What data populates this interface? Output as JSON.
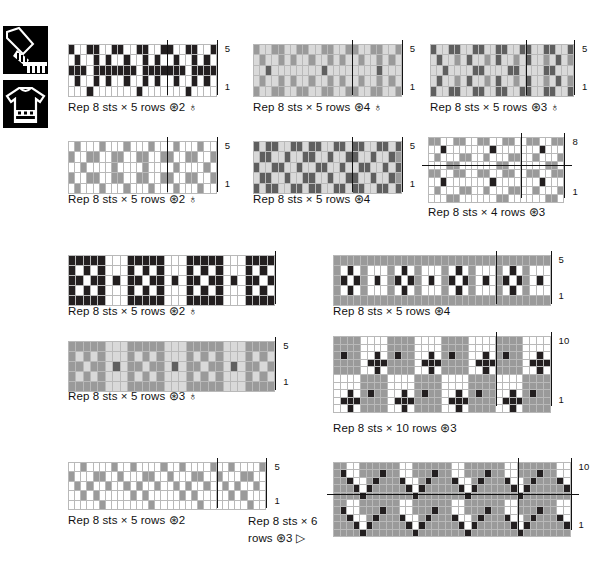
{
  "page": {
    "icons": [
      {
        "name": "cuff-icon",
        "label": "cuff"
      },
      {
        "name": "sweater-icon",
        "label": "sweater"
      }
    ],
    "palette": {
      "white": "#ffffff",
      "light_gray": "#d9d9d9",
      "medium_gray": "#9a9a9a",
      "dark_gray": "#5f5f5f",
      "black": "#231f20",
      "grid_line": "#b9b9b9",
      "marker_line": "#121212"
    },
    "symbols": {
      "yarn_ball": "⊛",
      "needle": "♁",
      "triangle": "▷",
      "multiply": "×"
    }
  },
  "charts": [
    {
      "id": "chart-1",
      "caption": "Rep 8 sts × 5 rows  ⊛2 ♁",
      "rep_sts": 8,
      "rep_rows": 5,
      "yarns": 2,
      "has_needle": true,
      "row_labels": [
        {
          "text": "5",
          "row": 5
        },
        {
          "text": "1",
          "row": 1
        }
      ],
      "cols": 24,
      "rows": 5,
      "cellw": 6.2,
      "cellh": 9.4,
      "vlines": [
        16,
        24
      ],
      "hlines": [],
      "grid": [
        "kwwkkwwkkwwkkwwkkwwkkwwk",
        "wkwwkwkwwkwwkwkwwkwwkwkw",
        "kkkwkkkkkkkwkkkkkkkwkkkk",
        "wkwwkwkwwkwwkwkwwkwwkwkw",
        "wwwkwwwwwwwkwwwwwwwkwwww"
      ]
    },
    {
      "id": "chart-2",
      "caption": "Rep 8 sts × 5 rows  ⊛4 ♁",
      "rep_sts": 8,
      "rep_rows": 5,
      "yarns": 4,
      "has_needle": true,
      "row_labels": [
        {
          "text": "5",
          "row": 5
        },
        {
          "text": "1",
          "row": 1
        }
      ],
      "cols": 24,
      "rows": 5,
      "cellw": 6.2,
      "cellh": 9.4,
      "vlines": [
        16,
        24
      ],
      "hlines": [],
      "grid": [
        "mllmmllmmllmmllmmllmmllm",
        "lmllmlmllmllmlmllmllmlml",
        "lldlllllllldlllllllldlll",
        "lmllmlmllmllmlmllmllmlml",
        "mllmmllmmllmmllmmllmmllm"
      ]
    },
    {
      "id": "chart-3",
      "caption": "Rep 8 sts × 5 rows  ⊛3 ♁",
      "rep_sts": 8,
      "rep_rows": 5,
      "yarns": 3,
      "has_needle": true,
      "row_labels": [
        {
          "text": "5",
          "row": 5
        },
        {
          "text": "1",
          "row": 1
        }
      ],
      "cols": 24,
      "rows": 5,
      "cellw": 6.0,
      "cellh": 9.4,
      "vlines": [
        16,
        24
      ],
      "hlines": [],
      "grid": [
        "dllddllddllddllddllddlld",
        "ldllmldllmldllmldllmldlm",
        "lldllllddllllddllllddlll",
        "ldllmldllmldllmldllmldlm",
        "dllddllddllddllddllddlld"
      ]
    },
    {
      "id": "chart-4",
      "caption": "Rep 8 sts × 5 rows  ⊛2 ♁",
      "rep_sts": 8,
      "rep_rows": 5,
      "yarns": 2,
      "has_needle": true,
      "row_labels": [
        {
          "text": "5",
          "row": 5
        },
        {
          "text": "1",
          "row": 1
        }
      ],
      "cols": 24,
      "rows": 5,
      "cellw": 6.2,
      "cellh": 9.4,
      "vlines": [
        16,
        24
      ],
      "hlines": [],
      "grid": [
        "wmwwwmwwwmwwwmwwwmwwwmww",
        "mwwmmwwmmwwmmwwmmwwmmwwm",
        "wwmwwwwmwwwwmwwwwmwwwwmw",
        "mwwmmwwmmwwmmwwmmwwmmwwm",
        "wmwwwmwwwmwwwmwwwmwwwmww"
      ]
    },
    {
      "id": "chart-5",
      "caption": "Rep 8 sts × 5 rows  ⊛4",
      "rep_sts": 8,
      "rep_rows": 5,
      "yarns": 4,
      "has_needle": false,
      "row_labels": [
        {
          "text": "5",
          "row": 5
        },
        {
          "text": "1",
          "row": 1
        }
      ],
      "cols": 24,
      "rows": 5,
      "cellw": 6.2,
      "cellh": 9.4,
      "vlines": [
        16,
        24
      ],
      "hlines": [],
      "grid": [
        "dlddllddlddllddlddllddld",
        "lddlldllddlldllddlldllds",
        "dllddlldllddlldllddlldld",
        "lddlldllddlldllddlldllds",
        "dlddllddlddllddlddllddld"
      ]
    },
    {
      "id": "chart-6",
      "caption": "Rep 8 sts × 4 rows  ⊛3",
      "rep_sts": 8,
      "rep_rows": 4,
      "yarns": 3,
      "has_needle": false,
      "row_labels": [
        {
          "text": "8",
          "row": 8
        },
        {
          "text": "1",
          "row": 1
        }
      ],
      "cols": 22,
      "rows": 8,
      "cellw": 6.2,
      "cellh": 7.1,
      "vlines": [
        15,
        22
      ],
      "hlines": [
        4
      ],
      "grid": [
        "mmwwmmwwmmwwmmwwmmwwmm",
        "wwkwwwwwwwkwwwwwwwkwww",
        "wmwwwmmwwmwwwmmwwmwwwm",
        "wwwmmwwwwwwmmwwwwwwmmw",
        "mmwwmmwwmmwwmmwwmmwwmm",
        "wwkwwwwwwwkwwwwwwwkwww",
        "wmwwwmmwwmwwwmmwwmwwwm",
        "wwwmmwwwwwwmmwwwwwwmmw"
      ]
    },
    {
      "id": "chart-7",
      "caption": "Rep 8 sts × 5 rows  ⊛2 ♁",
      "rep_sts": 8,
      "rep_rows": 5,
      "yarns": 2,
      "has_needle": true,
      "row_labels": [],
      "cols": 28,
      "rows": 5,
      "cellw": 7.4,
      "cellh": 9.0,
      "vlines": [
        28
      ],
      "hlines": [],
      "grid": [
        "kkkkkwwwkkkkkwwwkkkkkwwwkkkk",
        "kwkwkwwwkwkwkwwwkwkwkwwwkwkw",
        "kkwkkwkwkkwkkwkwkkwkkwkwkkwk",
        "kwkwkwwwkwkwkwwwkwkwkwwwkwkw",
        "kkkkkwwwkkkkkwwwkkkkkwwwkkkk"
      ]
    },
    {
      "id": "chart-8",
      "caption": "Rep 8 sts × 5 rows  ⊛4",
      "rep_sts": 8,
      "rep_rows": 5,
      "yarns": 4,
      "has_needle": false,
      "row_labels": [
        {
          "text": "5",
          "row": 5
        },
        {
          "text": "1",
          "row": 1
        }
      ],
      "cols": 32,
      "rows": 5,
      "cellw": 6.8,
      "cellh": 9.0,
      "vlines": [
        24,
        32
      ],
      "hlines": [],
      "grid": [
        "mmmmmmmmmmmmmmmmmmmmmmmmmmmmmmmm",
        "mwkwmwwwmwkwmwwwmwkwmwwwmwkwmwww",
        "mkwkmwkwmkwkmwkwmkwkmwkwmkwkmwkw",
        "mwkwmwwwmwkwmwwwmwkwmwwwmwkwmwww",
        "mmmmmmmmmmmmmmmmmmmmmmmmmmmmmmmm"
      ]
    },
    {
      "id": "chart-9",
      "caption": "Rep 8 sts × 5 rows  ⊛3 ♁",
      "rep_sts": 8,
      "rep_rows": 5,
      "yarns": 3,
      "has_needle": true,
      "row_labels": [
        {
          "text": "5",
          "row": 5
        },
        {
          "text": "1",
          "row": 1
        }
      ],
      "cols": 28,
      "rows": 5,
      "cellw": 7.4,
      "cellh": 9.0,
      "vlines": [
        28
      ],
      "hlines": [],
      "grid": [
        "mmmmmlllmmmmmlllmmmmmlllmmmm",
        "mlmlmlllmlmlmlllmlmlmlllmlml",
        "mmlmmldlmmlmmldlmmlmmldlmmlm",
        "mlmlmlllmlmlmlllmlmlmlllmlml",
        "mmmmmlllmmmmmlllmmmmmlllmmmm"
      ]
    },
    {
      "id": "chart-10",
      "caption": "Rep 8 sts × 10 rows  ⊛3",
      "rep_sts": 8,
      "rep_rows": 10,
      "yarns": 3,
      "has_needle": false,
      "row_labels": [
        {
          "text": "10",
          "row": 10
        },
        {
          "text": "1",
          "row": 1
        }
      ],
      "cols": 32,
      "rows": 10,
      "cellw": 6.8,
      "cellh": 6.6,
      "vlines": [
        24,
        32
      ],
      "hlines": [],
      "grid": [
        "mmmmwwwwmmmmwwwwmmmmwwwwmmmmwwww",
        "mmmmwwwwmmmmwwwwmmmmwwwwmmmmwwww",
        "mkmmwwkwmkmmwwkwmkmmwwkwmkmmwwkw",
        "mmmmwkkkmmmmwkkkmmmmwkkkmmmmwkkk",
        "mmmmwwkwmmmmwwkwmmmmwwkwmmmmwwkw",
        "wwwwmmmmwwwwmmmmwwwwmmmmwwwwmmmm",
        "wwwwmmmmwwwwmmmmwwwwmmmmwwwwmmmm",
        "wwkwmkmmwwkwmkmmwwkwmkmmwwkwmkmm",
        "wkkkmmmmwkkkmmmmwkkkmmmmwkkkmmmm",
        "wwkwmmmmwwkwmmmmwwkwmmmmwwkwmmmm"
      ]
    },
    {
      "id": "chart-11",
      "caption": "Rep 8 sts × 5 rows  ⊛2",
      "rep_sts": 8,
      "rep_rows": 5,
      "yarns": 2,
      "has_needle": false,
      "row_labels": [
        {
          "text": "5",
          "row": 5
        },
        {
          "text": "1",
          "row": 1
        }
      ],
      "cols": 32,
      "rows": 5,
      "cellw": 6.2,
      "cellh": 8.4,
      "vlines": [
        24,
        32
      ],
      "hlines": [],
      "grid": [
        "wwmwwwwmwwmwwwwmwwmwwwwmwwmwwwwm",
        "mwwwmmwwmwwwmmwwmwwwmmwwmwwwmmww",
        "wmwmwwmwwmwmwwmwwmwmwwmwwmwmwwmw",
        "wwmwmwwwwwmwmwwwwwmwmwwwwwmwmwww",
        "wwwwwmwwwwwwwmwwwwwwwmwwwwwwwmww"
      ]
    },
    {
      "id": "chart-12",
      "caption": "Rep 8 sts × 6 rows  ⊛3 ▷",
      "rep_sts": 8,
      "rep_rows": 6,
      "yarns": 3,
      "has_needle": false,
      "has_triangle": true,
      "row_labels": [
        {
          "text": "10",
          "row": 10
        },
        {
          "text": "1",
          "row": 1
        }
      ],
      "cols": 36,
      "rows": 10,
      "cellw": 6.6,
      "cellh": 6.4,
      "vlines": [
        28,
        36
      ],
      "hlines": [
        5
      ],
      "grid": [
        "mmwwmmmmmmwwmmmmmmwwmmmmmmwwmmmmmmww",
        "mkwwmmmkmmwwmmmkmmwwmmmkmmwwmmmkmmww",
        "mmkwwmkmmmkwwmkmmmkwwmkmmmkwwmkmmmkw",
        "mmmkwkmmmmmkwkmmmmmkwkmmmmmkwkmmmmmk",
        "mmmmkmmmmmmmkmmmmmmmkmmmmmmmkmmmmmmm",
        "mmwwmmmmmmwwmmmmmmwwmmmmmmwwmmmmmmww",
        "mkwwmmmkmmwwmmmkmmwwmmmkmmwwmmmkmmww",
        "mmkwwmkmmmkwwmkmmmkwwmkmmmkwwmkmmmkw",
        "mmmkwkmmmmmkwkmmmmmkwkmmmmmkwkmmmmmk",
        "mmmmkmmmmmmmkmmmmmmmkmmmmmmmkmmmmmmm"
      ]
    }
  ],
  "captions_extra": {
    "bottom_right_wrapped": [
      "Rep 8 sts × 6",
      "rows  ⊛3 ▷"
    ]
  }
}
